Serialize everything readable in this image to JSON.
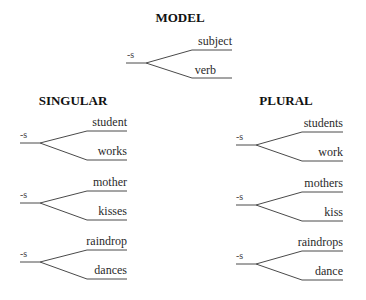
{
  "model": {
    "heading": "MODEL",
    "suffix": "-s",
    "upper": "subject",
    "lower": "verb"
  },
  "singular": {
    "heading": "SINGULAR",
    "diagrams": [
      {
        "suffix": "-s",
        "upper": "student",
        "lower": "works"
      },
      {
        "suffix": "-s",
        "upper": "mother",
        "lower": "kisses"
      },
      {
        "suffix": "-s",
        "upper": "raindrop",
        "lower": "dances"
      }
    ]
  },
  "plural": {
    "heading": "PLURAL",
    "diagrams": [
      {
        "suffix": "-s",
        "upper": "students",
        "lower": "work"
      },
      {
        "suffix": "-s",
        "upper": "mothers",
        "lower": "kiss"
      },
      {
        "suffix": "-s",
        "upper": "raindrops",
        "lower": "dance"
      }
    ]
  }
}
